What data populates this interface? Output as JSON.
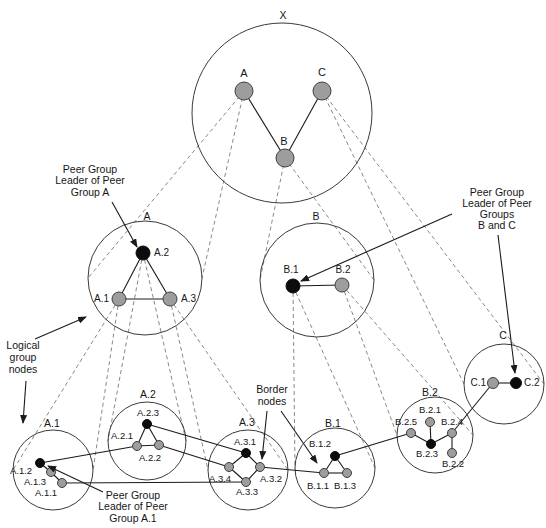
{
  "figure": {
    "width": 546,
    "height": 528,
    "background": "#ffffff",
    "ink": "#1a1a1a",
    "circle_stroke": "#3a3a3a",
    "dash_color": "#7a7a7a",
    "node_gray_fill": "#9d9d9d",
    "node_gray_stroke": "#3f3f3f",
    "node_black_fill": "#0c0c0c"
  },
  "diagram": {
    "groups": [
      {
        "id": "X",
        "label": "X",
        "cx": 282,
        "cy": 113,
        "r": 90,
        "lx": 283,
        "ly": 16
      },
      {
        "id": "A",
        "label": "A",
        "cx": 145,
        "cy": 278,
        "r": 57,
        "lx": 147,
        "ly": 217
      },
      {
        "id": "B",
        "label": "B",
        "cx": 317,
        "cy": 280,
        "r": 57,
        "lx": 316,
        "ly": 217
      },
      {
        "id": "C",
        "label": "C",
        "cx": 504,
        "cy": 384,
        "r": 40,
        "lx": 503,
        "ly": 336
      },
      {
        "id": "A1",
        "label": "A.1",
        "cx": 53,
        "cy": 470,
        "r": 40,
        "lx": 52,
        "ly": 424
      },
      {
        "id": "A2",
        "label": "A.2",
        "cx": 147,
        "cy": 441,
        "r": 39,
        "lx": 148,
        "ly": 395
      },
      {
        "id": "A3",
        "label": "A.3",
        "cx": 248,
        "cy": 470,
        "r": 40,
        "lx": 247,
        "ly": 423
      },
      {
        "id": "B1",
        "label": "B.1",
        "cx": 335,
        "cy": 468,
        "r": 40,
        "lx": 333,
        "ly": 424
      },
      {
        "id": "B2",
        "label": "B.2",
        "cx": 435,
        "cy": 435,
        "r": 38,
        "lx": 430,
        "ly": 393
      }
    ],
    "nodes": [
      {
        "id": "X.A",
        "label": "A",
        "x": 244,
        "y": 91,
        "r": 9,
        "color": "gray",
        "level": "top",
        "lx": 244,
        "ly": 74,
        "anchor": "middle"
      },
      {
        "id": "X.C",
        "label": "C",
        "x": 322,
        "y": 91,
        "r": 9,
        "color": "gray",
        "level": "top",
        "lx": 322,
        "ly": 73,
        "anchor": "middle"
      },
      {
        "id": "X.B",
        "label": "B",
        "x": 285,
        "y": 158,
        "r": 9,
        "color": "gray",
        "level": "top",
        "lx": 284,
        "ly": 142,
        "anchor": "middle"
      },
      {
        "id": "A.2",
        "label": "A.2",
        "x": 143,
        "y": 253,
        "r": 7,
        "color": "black",
        "level": "mid",
        "lx": 154,
        "ly": 253,
        "anchor": "start"
      },
      {
        "id": "A.1",
        "label": "A.1",
        "x": 119,
        "y": 299,
        "r": 7,
        "color": "gray",
        "level": "mid",
        "lx": 109,
        "ly": 299,
        "anchor": "end"
      },
      {
        "id": "A.3",
        "label": "A.3",
        "x": 170,
        "y": 299,
        "r": 7,
        "color": "gray",
        "level": "mid",
        "lx": 181,
        "ly": 299,
        "anchor": "start"
      },
      {
        "id": "B.1",
        "label": "B.1",
        "x": 293,
        "y": 286,
        "r": 7,
        "color": "black",
        "level": "mid",
        "lx": 291,
        "ly": 270,
        "anchor": "middle"
      },
      {
        "id": "B.2",
        "label": "B.2",
        "x": 342,
        "y": 285,
        "r": 7,
        "color": "gray",
        "level": "mid",
        "lx": 343,
        "ly": 270,
        "anchor": "middle"
      },
      {
        "id": "C.1",
        "label": "C.1",
        "x": 493,
        "y": 383,
        "r": 5.5,
        "color": "gray",
        "level": "mid",
        "lx": 486,
        "ly": 383,
        "anchor": "end"
      },
      {
        "id": "C.2",
        "label": "C.2",
        "x": 516,
        "y": 383,
        "r": 5.5,
        "color": "black",
        "level": "mid",
        "lx": 524,
        "ly": 383,
        "anchor": "start"
      },
      {
        "id": "A.1.2",
        "label": "A.1.2",
        "x": 40,
        "y": 463,
        "r": 4.5,
        "color": "black",
        "level": "leaf",
        "lx": 21,
        "ly": 471,
        "anchor": "middle"
      },
      {
        "id": "A.1.3",
        "label": "A.1.3",
        "x": 51,
        "y": 472,
        "r": 4.5,
        "color": "gray",
        "level": "leaf",
        "lx": 35,
        "ly": 482,
        "anchor": "middle"
      },
      {
        "id": "A.1.1",
        "label": "A.1.1",
        "x": 62,
        "y": 483,
        "r": 4.5,
        "color": "gray",
        "level": "leaf",
        "lx": 46,
        "ly": 493,
        "anchor": "middle"
      },
      {
        "id": "A.2.3",
        "label": "A.2.3",
        "x": 147,
        "y": 424,
        "r": 4.5,
        "color": "black",
        "level": "leaf",
        "lx": 148,
        "ly": 413,
        "anchor": "middle"
      },
      {
        "id": "A.2.1",
        "label": "A.2.1",
        "x": 137,
        "y": 446,
        "r": 4.5,
        "color": "gray",
        "level": "leaf",
        "lx": 122,
        "ly": 436,
        "anchor": "middle"
      },
      {
        "id": "A.2.2",
        "label": "A.2.2",
        "x": 159,
        "y": 445,
        "r": 4.5,
        "color": "gray",
        "level": "leaf",
        "lx": 150,
        "ly": 458,
        "anchor": "middle"
      },
      {
        "id": "A.3.1",
        "label": "A.3.1",
        "x": 246,
        "y": 453,
        "r": 4.5,
        "color": "black",
        "level": "leaf",
        "lx": 245,
        "ly": 442,
        "anchor": "middle"
      },
      {
        "id": "A.3.4",
        "label": "A.3.4",
        "x": 229,
        "y": 467,
        "r": 4.5,
        "color": "gray",
        "level": "leaf",
        "lx": 220,
        "ly": 479,
        "anchor": "middle"
      },
      {
        "id": "A.3.2",
        "label": "A.3.2",
        "x": 260,
        "y": 467,
        "r": 4.5,
        "color": "gray",
        "level": "leaf",
        "lx": 271,
        "ly": 479,
        "anchor": "middle"
      },
      {
        "id": "A.3.3",
        "label": "A.3.3",
        "x": 246,
        "y": 482,
        "r": 4.5,
        "color": "gray",
        "level": "leaf",
        "lx": 247,
        "ly": 492,
        "anchor": "middle"
      },
      {
        "id": "B.1.2",
        "label": "B.1.2",
        "x": 335,
        "y": 456,
        "r": 4.5,
        "color": "black",
        "level": "leaf",
        "lx": 320,
        "ly": 444,
        "anchor": "middle"
      },
      {
        "id": "B.1.1",
        "label": "B.1.1",
        "x": 324,
        "y": 473,
        "r": 4.5,
        "color": "gray",
        "level": "leaf",
        "lx": 318,
        "ly": 486,
        "anchor": "middle"
      },
      {
        "id": "B.1.3",
        "label": "B.1.3",
        "x": 347,
        "y": 473,
        "r": 4.5,
        "color": "gray",
        "level": "leaf",
        "lx": 345,
        "ly": 486,
        "anchor": "middle"
      },
      {
        "id": "B.2.1",
        "label": "B.2.1",
        "x": 430,
        "y": 422,
        "r": 4.5,
        "color": "gray",
        "level": "leaf",
        "lx": 430,
        "ly": 410,
        "anchor": "middle"
      },
      {
        "id": "B.2.5",
        "label": "B.2.5",
        "x": 411,
        "y": 433,
        "r": 4.5,
        "color": "gray",
        "level": "leaf",
        "lx": 406,
        "ly": 422,
        "anchor": "middle"
      },
      {
        "id": "B.2.4",
        "label": "B.2.4",
        "x": 452,
        "y": 433,
        "r": 4.5,
        "color": "gray",
        "level": "leaf",
        "lx": 452,
        "ly": 422,
        "anchor": "middle"
      },
      {
        "id": "B.2.3",
        "label": "B.2.3",
        "x": 431,
        "y": 444,
        "r": 4.5,
        "color": "black",
        "level": "leaf",
        "lx": 427,
        "ly": 454,
        "anchor": "middle"
      },
      {
        "id": "B.2.2",
        "label": "B.2.2",
        "x": 452,
        "y": 453,
        "r": 4.5,
        "color": "gray",
        "level": "leaf",
        "lx": 453,
        "ly": 464,
        "anchor": "middle"
      }
    ],
    "links": [
      [
        "X.A",
        "X.B"
      ],
      [
        "X.B",
        "X.C"
      ],
      [
        "A.2",
        "A.1"
      ],
      [
        "A.2",
        "A.3"
      ],
      [
        "A.1",
        "A.3"
      ],
      [
        "B.1",
        "B.2"
      ],
      [
        "C.1",
        "C.2"
      ],
      [
        "A.1.2",
        "A.1.3"
      ],
      [
        "A.1.3",
        "A.1.1"
      ],
      [
        "A.2.3",
        "A.2.1"
      ],
      [
        "A.2.3",
        "A.2.2"
      ],
      [
        "A.2.1",
        "A.2.2"
      ],
      [
        "A.3.1",
        "A.3.4"
      ],
      [
        "A.3.1",
        "A.3.2"
      ],
      [
        "A.3.4",
        "A.3.3"
      ],
      [
        "A.3.2",
        "A.3.3"
      ],
      [
        "B.1.2",
        "B.1.1"
      ],
      [
        "B.1.2",
        "B.1.3"
      ],
      [
        "B.1.1",
        "B.1.3"
      ],
      [
        "B.2.3",
        "B.2.1"
      ],
      [
        "B.2.3",
        "B.2.5"
      ],
      [
        "B.2.3",
        "B.2.4"
      ],
      [
        "B.2.4",
        "B.2.2"
      ],
      [
        "A.1.2",
        "A.2.1"
      ],
      [
        "A.1.1",
        "A.3.3"
      ],
      [
        "A.2.3",
        "A.3.1"
      ],
      [
        "A.2.2",
        "A.3.4"
      ],
      [
        "A.3.2",
        "B.1.1"
      ],
      [
        "B.1.2",
        "B.2.5"
      ],
      [
        "B.2.4",
        "C.1"
      ]
    ],
    "hierarchy_links": [
      {
        "parent": "X.A",
        "group": "A"
      },
      {
        "parent": "X.B",
        "group": "B"
      },
      {
        "parent": "X.C",
        "group": "C"
      },
      {
        "parent": "A.1",
        "group": "A1"
      },
      {
        "parent": "A.2",
        "group": "A2"
      },
      {
        "parent": "A.3",
        "group": "A3"
      },
      {
        "parent": "B.1",
        "group": "B1"
      },
      {
        "parent": "B.2",
        "group": "B2"
      }
    ],
    "annotations": [
      {
        "id": "peer-group-leader-a",
        "x": 90,
        "y": 170,
        "line_h": 11.5,
        "lines": [
          "Peer Group",
          "Leader of Peer",
          "Group A"
        ],
        "arrows": [
          [
            112,
            202,
            137,
            247
          ]
        ]
      },
      {
        "id": "peer-group-leader-bc",
        "x": 497,
        "y": 193,
        "line_h": 11,
        "lines": [
          "Peer Group",
          "Leader of Peer",
          "Groups",
          "B and C"
        ],
        "arrows": [
          [
            452,
            214,
            301,
            281
          ],
          [
            498,
            235,
            515,
            373
          ]
        ]
      },
      {
        "id": "logical-group-nodes",
        "x": 23,
        "y": 346,
        "line_h": 12,
        "lines": [
          "Logical",
          "group",
          "nodes"
        ],
        "arrows": [
          [
            35,
            339,
            86,
            317
          ],
          [
            26,
            381,
            23,
            423
          ]
        ]
      },
      {
        "id": "border-nodes",
        "x": 272,
        "y": 390,
        "line_h": 12.5,
        "lines": [
          "Border",
          "nodes"
        ],
        "arrows": [
          [
            267,
            411,
            262,
            459
          ],
          [
            281,
            411,
            317,
            463
          ]
        ]
      },
      {
        "id": "peer-group-leader-a1",
        "x": 133,
        "y": 496,
        "line_h": 11.5,
        "lines": [
          "Peer Group",
          "Leader of Peer",
          "Group A.1"
        ],
        "arrows": [
          [
            103,
            492,
            48,
            466
          ]
        ]
      }
    ]
  }
}
